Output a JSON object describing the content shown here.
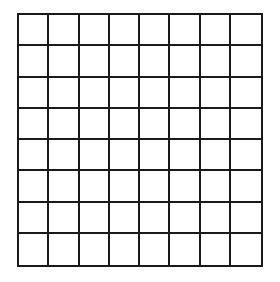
{
  "grid": {
    "rows": 8,
    "cols": 8,
    "line_color": "#1a1a1a",
    "cell_fill": "#ffffff",
    "cells_filled": []
  }
}
